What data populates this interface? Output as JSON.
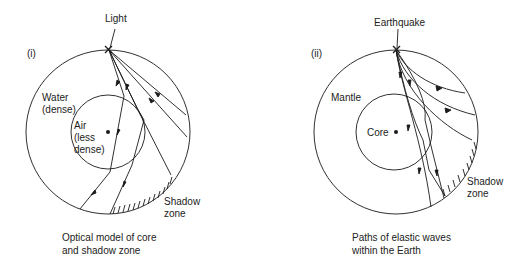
{
  "panel_i": {
    "number": "(i)",
    "source_label": "Light",
    "outer_label_1": "Water",
    "outer_label_2": "(dense)",
    "inner_label_1": "Air",
    "inner_label_2": "(less",
    "inner_label_3": "dense)",
    "shadow_label_1": "Shadow",
    "shadow_label_2": "zone",
    "caption_1": "Optical model of core",
    "caption_2": "and shadow zone"
  },
  "panel_ii": {
    "number": "(ii)",
    "source_label": "Earthquake",
    "outer_label": "Mantle",
    "inner_label": "Core",
    "shadow_label_1": "Shadow",
    "shadow_label_2": "zone",
    "caption_1": "Paths of elastic waves",
    "caption_2": "within the Earth"
  },
  "colors": {
    "line": "#1a1a1a",
    "background": "#ffffff"
  }
}
